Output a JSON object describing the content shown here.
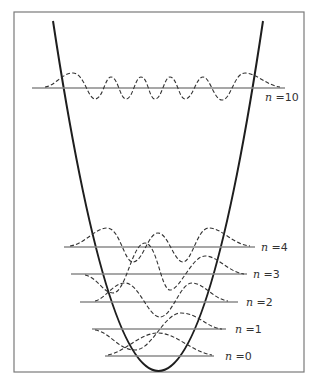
{
  "figure": {
    "colors": {
      "frame": "#7a7a7a",
      "potential": "#1e1e1e",
      "level_line": "#8a8a8a",
      "wavefunction": "#333333"
    },
    "levels": [
      {
        "n_symbol": "n",
        "equals_value": " =0",
        "label": "n =0"
      },
      {
        "n_symbol": "n",
        "equals_value": " =1",
        "label": "n =1"
      },
      {
        "n_symbol": "n",
        "equals_value": " =2",
        "label": "n =2"
      },
      {
        "n_symbol": "n",
        "equals_value": " =3",
        "label": "n =3"
      },
      {
        "n_symbol": "n",
        "equals_value": " =4",
        "label": "n =4"
      },
      {
        "n_symbol": "n",
        "equals_value": " =10",
        "label": "n =10"
      }
    ]
  }
}
